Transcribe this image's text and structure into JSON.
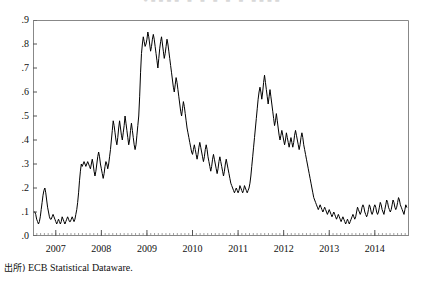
{
  "figure": {
    "clipped_header_text": "●■■■■   ■   ■   ■   ■  ■   ■■■■",
    "source_prefix": "出所)",
    "source_text": "ECB Statistical Dataware."
  },
  "chart_data": {
    "type": "line",
    "title": "",
    "subtitle": "",
    "xlabel": "",
    "ylabel": "",
    "grid": false,
    "legend": "none",
    "line_color": "#000000",
    "frame_color": "#888888",
    "xlim": [
      2006.5,
      2014.75
    ],
    "ylim": [
      0.0,
      0.9
    ],
    "ytick_labels": [
      ".0",
      ".1",
      ".2",
      ".3",
      ".4",
      ".5",
      ".6",
      ".7",
      ".8",
      ".9"
    ],
    "ytick_values": [
      0.0,
      0.1,
      0.2,
      0.3,
      0.4,
      0.5,
      0.6,
      0.7,
      0.8,
      0.9
    ],
    "xtick_labels": [
      "2007",
      "2008",
      "2009",
      "2010",
      "2011",
      "2012",
      "2013",
      "2014"
    ],
    "xtick_values": [
      2007,
      2008,
      2009,
      2010,
      2011,
      2012,
      2013,
      2014
    ],
    "minor_xticks_per_year": 12,
    "series": [
      {
        "name": "spread",
        "x": [
          2006.54,
          2006.56,
          2006.58,
          2006.6,
          2006.62,
          2006.64,
          2006.66,
          2006.68,
          2006.7,
          2006.72,
          2006.74,
          2006.76,
          2006.78,
          2006.8,
          2006.82,
          2006.84,
          2006.86,
          2006.88,
          2006.9,
          2006.92,
          2006.94,
          2006.96,
          2006.98,
          2007.0,
          2007.02,
          2007.04,
          2007.06,
          2007.08,
          2007.1,
          2007.12,
          2007.14,
          2007.16,
          2007.18,
          2007.2,
          2007.22,
          2007.24,
          2007.26,
          2007.28,
          2007.3,
          2007.32,
          2007.34,
          2007.36,
          2007.38,
          2007.4,
          2007.42,
          2007.44,
          2007.46,
          2007.48,
          2007.5,
          2007.52,
          2007.54,
          2007.56,
          2007.58,
          2007.6,
          2007.62,
          2007.64,
          2007.66,
          2007.68,
          2007.7,
          2007.72,
          2007.74,
          2007.76,
          2007.78,
          2007.8,
          2007.82,
          2007.84,
          2007.86,
          2007.88,
          2007.9,
          2007.92,
          2007.94,
          2007.96,
          2007.98,
          2008.0,
          2008.02,
          2008.04,
          2008.06,
          2008.08,
          2008.1,
          2008.12,
          2008.14,
          2008.16,
          2008.18,
          2008.2,
          2008.22,
          2008.24,
          2008.26,
          2008.28,
          2008.3,
          2008.32,
          2008.34,
          2008.36,
          2008.38,
          2008.4,
          2008.42,
          2008.44,
          2008.46,
          2008.48,
          2008.5,
          2008.52,
          2008.54,
          2008.56,
          2008.58,
          2008.6,
          2008.62,
          2008.64,
          2008.66,
          2008.68,
          2008.7,
          2008.72,
          2008.74,
          2008.76,
          2008.78,
          2008.8,
          2008.82,
          2008.84,
          2008.86,
          2008.88,
          2008.9,
          2008.92,
          2008.94,
          2008.96,
          2008.98,
          2009.0,
          2009.02,
          2009.04,
          2009.06,
          2009.08,
          2009.1,
          2009.12,
          2009.14,
          2009.16,
          2009.18,
          2009.2,
          2009.22,
          2009.24,
          2009.26,
          2009.28,
          2009.3,
          2009.32,
          2009.34,
          2009.36,
          2009.38,
          2009.4,
          2009.42,
          2009.44,
          2009.46,
          2009.48,
          2009.5,
          2009.52,
          2009.54,
          2009.56,
          2009.58,
          2009.6,
          2009.62,
          2009.64,
          2009.66,
          2009.68,
          2009.7,
          2009.72,
          2009.74,
          2009.76,
          2009.78,
          2009.8,
          2009.82,
          2009.84,
          2009.86,
          2009.88,
          2009.9,
          2009.92,
          2009.94,
          2009.96,
          2009.98,
          2010.0,
          2010.02,
          2010.04,
          2010.06,
          2010.08,
          2010.1,
          2010.12,
          2010.14,
          2010.16,
          2010.18,
          2010.2,
          2010.22,
          2010.24,
          2010.26,
          2010.28,
          2010.3,
          2010.32,
          2010.34,
          2010.36,
          2010.38,
          2010.4,
          2010.42,
          2010.44,
          2010.46,
          2010.48,
          2010.5,
          2010.52,
          2010.54,
          2010.56,
          2010.58,
          2010.6,
          2010.62,
          2010.64,
          2010.66,
          2010.68,
          2010.7,
          2010.72,
          2010.74,
          2010.76,
          2010.78,
          2010.8,
          2010.82,
          2010.84,
          2010.86,
          2010.88,
          2010.9,
          2010.92,
          2010.94,
          2010.96,
          2010.98,
          2011.0,
          2011.02,
          2011.04,
          2011.06,
          2011.08,
          2011.1,
          2011.12,
          2011.14,
          2011.16,
          2011.18,
          2011.2,
          2011.22,
          2011.24,
          2011.26,
          2011.28,
          2011.3,
          2011.32,
          2011.34,
          2011.36,
          2011.38,
          2011.4,
          2011.42,
          2011.44,
          2011.46,
          2011.48,
          2011.5,
          2011.52,
          2011.54,
          2011.56,
          2011.58,
          2011.6,
          2011.62,
          2011.64,
          2011.66,
          2011.68,
          2011.7,
          2011.72,
          2011.74,
          2011.76,
          2011.78,
          2011.8,
          2011.82,
          2011.84,
          2011.86,
          2011.88,
          2011.9,
          2011.92,
          2011.94,
          2011.96,
          2011.98,
          2012.0,
          2012.02,
          2012.04,
          2012.06,
          2012.08,
          2012.1,
          2012.12,
          2012.14,
          2012.16,
          2012.18,
          2012.2,
          2012.22,
          2012.24,
          2012.26,
          2012.28,
          2012.3,
          2012.32,
          2012.34,
          2012.36,
          2012.38,
          2012.4,
          2012.42,
          2012.44,
          2012.46,
          2012.48,
          2012.5,
          2012.52,
          2012.54,
          2012.56,
          2012.58,
          2012.6,
          2012.62,
          2012.64,
          2012.66,
          2012.68,
          2012.7,
          2012.72,
          2012.74,
          2012.76,
          2012.78,
          2012.8,
          2012.82,
          2012.84,
          2012.86,
          2012.88,
          2012.9,
          2012.92,
          2012.94,
          2012.96,
          2012.98,
          2013.0,
          2013.02,
          2013.04,
          2013.06,
          2013.08,
          2013.1,
          2013.12,
          2013.14,
          2013.16,
          2013.18,
          2013.2,
          2013.22,
          2013.24,
          2013.26,
          2013.28,
          2013.3,
          2013.32,
          2013.34,
          2013.36,
          2013.38,
          2013.4,
          2013.42,
          2013.44,
          2013.46,
          2013.48,
          2013.5,
          2013.52,
          2013.54,
          2013.56,
          2013.58,
          2013.6,
          2013.62,
          2013.64,
          2013.66,
          2013.68,
          2013.7,
          2013.72,
          2013.74,
          2013.76,
          2013.78,
          2013.8,
          2013.82,
          2013.84,
          2013.86,
          2013.88,
          2013.9,
          2013.92,
          2013.94,
          2013.96,
          2013.98,
          2014.0,
          2014.02,
          2014.04,
          2014.06,
          2014.08,
          2014.1,
          2014.12,
          2014.14,
          2014.16,
          2014.18,
          2014.2,
          2014.22,
          2014.24,
          2014.26,
          2014.28,
          2014.3,
          2014.32,
          2014.34,
          2014.36,
          2014.38,
          2014.4,
          2014.42,
          2014.44,
          2014.46,
          2014.48,
          2014.5,
          2014.52,
          2014.54,
          2014.56,
          2014.58,
          2014.6,
          2014.62,
          2014.64,
          2014.66,
          2014.68,
          2014.7
        ],
        "values": [
          0.1,
          0.09,
          0.07,
          0.06,
          0.05,
          0.06,
          0.08,
          0.11,
          0.14,
          0.17,
          0.19,
          0.2,
          0.18,
          0.15,
          0.12,
          0.1,
          0.08,
          0.07,
          0.07,
          0.08,
          0.09,
          0.08,
          0.07,
          0.06,
          0.05,
          0.06,
          0.07,
          0.06,
          0.05,
          0.06,
          0.08,
          0.07,
          0.06,
          0.05,
          0.06,
          0.07,
          0.08,
          0.07,
          0.06,
          0.06,
          0.07,
          0.08,
          0.07,
          0.06,
          0.07,
          0.09,
          0.11,
          0.14,
          0.18,
          0.23,
          0.27,
          0.3,
          0.29,
          0.3,
          0.31,
          0.3,
          0.29,
          0.3,
          0.31,
          0.3,
          0.29,
          0.28,
          0.3,
          0.32,
          0.3,
          0.27,
          0.25,
          0.27,
          0.3,
          0.33,
          0.35,
          0.33,
          0.3,
          0.28,
          0.26,
          0.24,
          0.26,
          0.29,
          0.31,
          0.3,
          0.28,
          0.3,
          0.33,
          0.36,
          0.4,
          0.44,
          0.48,
          0.46,
          0.43,
          0.4,
          0.38,
          0.41,
          0.45,
          0.48,
          0.45,
          0.42,
          0.4,
          0.43,
          0.46,
          0.5,
          0.47,
          0.44,
          0.41,
          0.38,
          0.4,
          0.44,
          0.47,
          0.44,
          0.41,
          0.38,
          0.36,
          0.38,
          0.42,
          0.46,
          0.5,
          0.58,
          0.68,
          0.76,
          0.8,
          0.83,
          0.81,
          0.79,
          0.8,
          0.82,
          0.85,
          0.83,
          0.8,
          0.77,
          0.79,
          0.82,
          0.84,
          0.82,
          0.79,
          0.76,
          0.73,
          0.7,
          0.74,
          0.78,
          0.81,
          0.83,
          0.8,
          0.77,
          0.74,
          0.76,
          0.79,
          0.82,
          0.8,
          0.77,
          0.74,
          0.71,
          0.68,
          0.65,
          0.62,
          0.6,
          0.63,
          0.66,
          0.64,
          0.61,
          0.58,
          0.55,
          0.52,
          0.5,
          0.53,
          0.56,
          0.54,
          0.51,
          0.48,
          0.45,
          0.43,
          0.41,
          0.39,
          0.37,
          0.35,
          0.34,
          0.36,
          0.38,
          0.36,
          0.34,
          0.32,
          0.34,
          0.37,
          0.39,
          0.37,
          0.35,
          0.33,
          0.31,
          0.33,
          0.36,
          0.38,
          0.36,
          0.33,
          0.31,
          0.29,
          0.27,
          0.29,
          0.32,
          0.34,
          0.32,
          0.3,
          0.28,
          0.26,
          0.28,
          0.31,
          0.33,
          0.31,
          0.29,
          0.27,
          0.25,
          0.27,
          0.3,
          0.32,
          0.3,
          0.28,
          0.26,
          0.24,
          0.22,
          0.21,
          0.2,
          0.19,
          0.18,
          0.19,
          0.2,
          0.19,
          0.18,
          0.19,
          0.21,
          0.2,
          0.19,
          0.18,
          0.19,
          0.21,
          0.2,
          0.19,
          0.18,
          0.19,
          0.2,
          0.22,
          0.25,
          0.29,
          0.33,
          0.37,
          0.41,
          0.45,
          0.49,
          0.53,
          0.57,
          0.6,
          0.62,
          0.6,
          0.57,
          0.6,
          0.64,
          0.67,
          0.64,
          0.61,
          0.58,
          0.55,
          0.58,
          0.61,
          0.58,
          0.55,
          0.52,
          0.49,
          0.46,
          0.48,
          0.51,
          0.48,
          0.45,
          0.42,
          0.4,
          0.42,
          0.44,
          0.42,
          0.4,
          0.38,
          0.4,
          0.43,
          0.41,
          0.39,
          0.37,
          0.39,
          0.41,
          0.39,
          0.37,
          0.39,
          0.42,
          0.44,
          0.42,
          0.4,
          0.38,
          0.36,
          0.38,
          0.41,
          0.43,
          0.41,
          0.38,
          0.36,
          0.34,
          0.32,
          0.3,
          0.28,
          0.26,
          0.24,
          0.22,
          0.2,
          0.18,
          0.16,
          0.15,
          0.14,
          0.13,
          0.12,
          0.11,
          0.12,
          0.13,
          0.12,
          0.11,
          0.1,
          0.11,
          0.12,
          0.11,
          0.1,
          0.09,
          0.1,
          0.11,
          0.1,
          0.09,
          0.08,
          0.09,
          0.1,
          0.09,
          0.08,
          0.07,
          0.08,
          0.09,
          0.08,
          0.07,
          0.06,
          0.07,
          0.08,
          0.07,
          0.06,
          0.05,
          0.06,
          0.07,
          0.06,
          0.05,
          0.06,
          0.07,
          0.08,
          0.09,
          0.08,
          0.07,
          0.08,
          0.1,
          0.12,
          0.11,
          0.1,
          0.09,
          0.1,
          0.12,
          0.13,
          0.12,
          0.1,
          0.09,
          0.08,
          0.09,
          0.11,
          0.13,
          0.12,
          0.1,
          0.09,
          0.1,
          0.12,
          0.13,
          0.12,
          0.1,
          0.09,
          0.1,
          0.12,
          0.14,
          0.13,
          0.11,
          0.1,
          0.09,
          0.11,
          0.13,
          0.15,
          0.14,
          0.12,
          0.11,
          0.1,
          0.11,
          0.13,
          0.15,
          0.14,
          0.12,
          0.11,
          0.12,
          0.14,
          0.16,
          0.15,
          0.13,
          0.12,
          0.11,
          0.1,
          0.09,
          0.11,
          0.13,
          0.12
        ]
      }
    ]
  }
}
